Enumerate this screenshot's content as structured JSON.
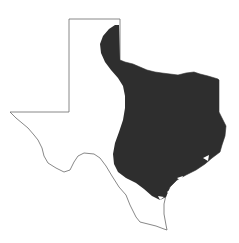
{
  "map": {
    "region": "Texas",
    "outline_color": "#6a6a6a",
    "range_fill_color": "#2e2e2e",
    "background_color": "#ffffff",
    "shaded_area": "central and eastern Texas range"
  }
}
